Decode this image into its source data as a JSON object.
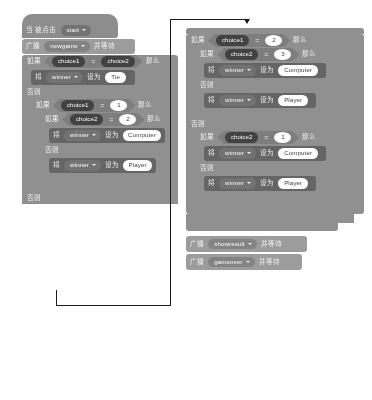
{
  "meta": {
    "app": "Scratch Block Editor",
    "language": "zh-CN",
    "appearance": "grayscale"
  },
  "labels": {
    "when_clicked": "当 被点击",
    "broadcast": "广播",
    "and_wait": "并等待",
    "if": "如果",
    "then": "那么",
    "else": "否则",
    "set": "将",
    "set_to": "设为",
    "equals": "="
  },
  "colors": {
    "control_block": "#8d8d8d",
    "data_block": "#5f5f5f",
    "event_block": "#9a9a9a",
    "variable_oval": "#3b3b3b",
    "input_field": "#ffffff",
    "annotation": "#111111",
    "page_background": "#ffffff"
  },
  "left_script": {
    "hat": {
      "prefix": "当 被点击",
      "dropdown": "start",
      "icon": "flag-icon"
    },
    "broadcast": {
      "verb": "广播",
      "message": "newgame",
      "suffix": "并等待"
    },
    "if1": {
      "keyword": "如果",
      "left": "choice1",
      "operator": "=",
      "right": "choice2",
      "then": "那么",
      "body": {
        "set_keyword": "将",
        "variable": "winner",
        "set_to": "设为",
        "value": "Tie"
      },
      "else": "否则"
    },
    "if2": {
      "keyword": "如果",
      "left": "choice1",
      "operator": "=",
      "right": "1",
      "then": "那么"
    },
    "if3": {
      "keyword": "如果",
      "left": "choice2",
      "operator": "=",
      "right": "2",
      "then": "那么",
      "body": {
        "set_keyword": "将",
        "variable": "winner",
        "set_to": "设为",
        "value": "Computer"
      },
      "else": "否则",
      "else_body": {
        "set_keyword": "将",
        "variable": "winner",
        "set_to": "设为",
        "value": "Player"
      }
    },
    "tail_else": "否则"
  },
  "right_script": {
    "if1": {
      "keyword": "如果",
      "left": "choice1",
      "operator": "=",
      "right": "2",
      "then": "那么"
    },
    "if2": {
      "keyword": "如果",
      "left": "choice2",
      "operator": "=",
      "right": "3",
      "then": "那么",
      "body": {
        "set_keyword": "将",
        "variable": "winner",
        "set_to": "设为",
        "value": "Computer"
      },
      "else": "否则",
      "else_body": {
        "set_keyword": "将",
        "variable": "winner",
        "set_to": "设为",
        "value": "Player"
      }
    },
    "outer_else": "否则",
    "if3": {
      "keyword": "如果",
      "left": "choice2",
      "operator": "=",
      "right": "1",
      "then": "那么",
      "body": {
        "set_keyword": "将",
        "variable": "winner",
        "set_to": "设为",
        "value": "Computer"
      },
      "else": "否则",
      "else_body": {
        "set_keyword": "将",
        "variable": "winner",
        "set_to": "设为",
        "value": "Player"
      }
    },
    "broadcast1": {
      "verb": "广播",
      "message": "showresult",
      "suffix": "并等待"
    },
    "broadcast2": {
      "verb": "广播",
      "message": "gameover",
      "suffix": "并等待"
    }
  }
}
